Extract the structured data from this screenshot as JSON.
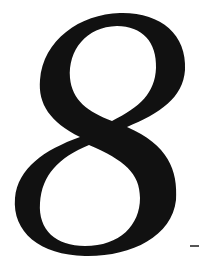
{
  "glyph": {
    "character": "8",
    "style": "italic serif numeral",
    "color": "#111111"
  },
  "dash": {
    "character": "-",
    "color": "#555555"
  },
  "background": "#ffffff"
}
